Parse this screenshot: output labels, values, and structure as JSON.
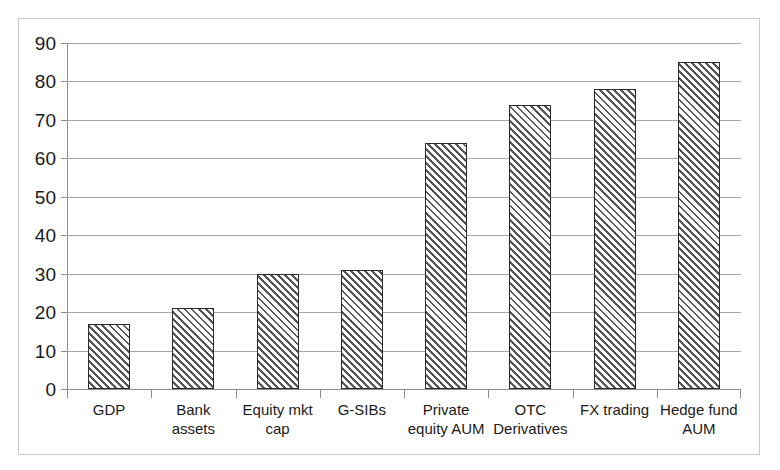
{
  "chart_data": {
    "type": "bar",
    "title": "",
    "subtitle": "",
    "xlabel": "",
    "ylabel": "",
    "ylim": [
      0,
      90
    ],
    "ytick_step": 10,
    "yticks": [
      90,
      80,
      70,
      60,
      50,
      40,
      30,
      20,
      10,
      0
    ],
    "grid": true,
    "legend": false,
    "legend_position": "none",
    "categories": [
      "GDP",
      "Bank assets",
      "Equity mkt cap",
      "G-SIBs",
      "Private equity AUM",
      "OTC Derivatives",
      "FX trading",
      "Hedge fund AUM"
    ],
    "values": [
      17,
      21,
      30,
      31,
      64,
      74,
      78,
      85
    ],
    "series": [
      {
        "name": "",
        "values": [
          17,
          21,
          30,
          31,
          64,
          74,
          78,
          85
        ]
      }
    ],
    "bar_fill": "diagonal-hatch",
    "bar_edge_color": "#2b2b2b",
    "gridline_color": "#a6a6a6",
    "axis_color": "#8d8d8d",
    "background_color": "#ffffff",
    "frame_border_color": "#c9c9c9"
  }
}
